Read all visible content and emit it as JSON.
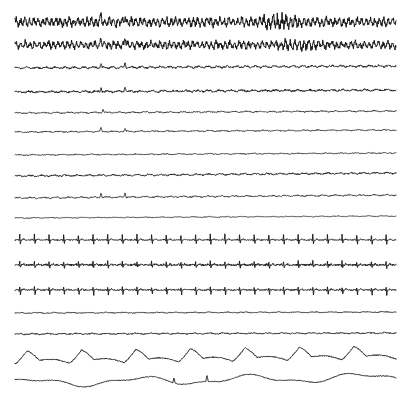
{
  "figure": {
    "type": "multichannel-biosignal-strip-chart",
    "background_color": "#ffffff",
    "trace_color": "#141414",
    "width_px": 410,
    "height_px": 397,
    "plot_left_px": 15,
    "plot_right_px": 396,
    "channel_count": 17
  },
  "chart_data": {
    "type": "line",
    "subtitle": "",
    "xlabel": "",
    "ylabel": "",
    "grid": false,
    "legend_position": "none",
    "xlim": [
      0,
      1
    ],
    "x_start_px": 15,
    "x_end_px": 396,
    "channels": [
      {
        "index": 1,
        "name": "eeg-1",
        "label": "",
        "baseline_y_px": 22,
        "style": "dense-eeg",
        "amplitude_px": 5.0,
        "noise_px": 1.6,
        "cycles": 86,
        "stroke_width": 1.0,
        "artifact_spikes": [
          {
            "x_px": 101,
            "amp_px": 7
          },
          {
            "x_px": 125,
            "amp_px": 8
          }
        ],
        "burst": {
          "x_px": 277,
          "width_px": 26,
          "gain": 1.9
        }
      },
      {
        "index": 2,
        "name": "eeg-2",
        "label": "",
        "baseline_y_px": 45,
        "style": "dense-eeg",
        "amplitude_px": 4.2,
        "noise_px": 1.5,
        "cycles": 82,
        "stroke_width": 1.0,
        "artifact_spikes": [
          {
            "x_px": 101,
            "amp_px": 8
          },
          {
            "x_px": 125,
            "amp_px": 9
          }
        ],
        "burst": {
          "x_px": 300,
          "width_px": 30,
          "gain": 1.7
        }
      },
      {
        "index": 3,
        "name": "eog-left",
        "label": "",
        "baseline_y_px": 68,
        "style": "flat",
        "amplitude_px": 0.7,
        "noise_px": 0.7,
        "cycles": 40,
        "stroke_width": 0.9,
        "drift_px": -2,
        "artifact_spikes": [
          {
            "x_px": 101,
            "amp_px": 4
          },
          {
            "x_px": 125,
            "amp_px": 5
          }
        ]
      },
      {
        "index": 4,
        "name": "eog-right",
        "label": "",
        "baseline_y_px": 92,
        "style": "flat",
        "amplitude_px": 0.6,
        "noise_px": 0.8,
        "cycles": 34,
        "stroke_width": 0.9,
        "drift_px": -2,
        "artifact_spikes": [
          {
            "x_px": 101,
            "amp_px": 5
          },
          {
            "x_px": 125,
            "amp_px": 6
          }
        ]
      },
      {
        "index": 5,
        "name": "emg-chin",
        "label": "",
        "baseline_y_px": 113,
        "style": "flat",
        "amplitude_px": 0.4,
        "noise_px": 0.5,
        "cycles": 30,
        "stroke_width": 0.8,
        "drift_px": -2,
        "artifact_spikes": [
          {
            "x_px": 103,
            "amp_px": 4
          }
        ]
      },
      {
        "index": 6,
        "name": "eeg-3",
        "label": "",
        "baseline_y_px": 132,
        "style": "flat",
        "amplitude_px": 0.35,
        "noise_px": 0.45,
        "cycles": 28,
        "stroke_width": 0.8,
        "drift_px": -2,
        "artifact_spikes": [
          {
            "x_px": 101,
            "amp_px": 4
          },
          {
            "x_px": 125,
            "amp_px": 3
          }
        ]
      },
      {
        "index": 7,
        "name": "eeg-4",
        "label": "",
        "baseline_y_px": 155,
        "style": "flat",
        "amplitude_px": 0.3,
        "noise_px": 0.4,
        "cycles": 26,
        "stroke_width": 0.8,
        "drift_px": -2,
        "artifact_spikes": []
      },
      {
        "index": 8,
        "name": "eeg-5",
        "label": "",
        "baseline_y_px": 176,
        "style": "flat",
        "amplitude_px": 0.5,
        "noise_px": 0.6,
        "cycles": 32,
        "stroke_width": 0.9,
        "drift_px": -3,
        "artifact_spikes": []
      },
      {
        "index": 9,
        "name": "eeg-6",
        "label": "",
        "baseline_y_px": 198,
        "style": "flat",
        "amplitude_px": 0.45,
        "noise_px": 0.5,
        "cycles": 30,
        "stroke_width": 0.8,
        "drift_px": -3,
        "artifact_spikes": [
          {
            "x_px": 101,
            "amp_px": 5
          },
          {
            "x_px": 125,
            "amp_px": 5
          }
        ]
      },
      {
        "index": 10,
        "name": "eeg-7",
        "label": "",
        "baseline_y_px": 218,
        "style": "flat",
        "amplitude_px": 0.25,
        "noise_px": 0.3,
        "cycles": 24,
        "stroke_width": 0.8,
        "drift_px": -2,
        "artifact_spikes": []
      },
      {
        "index": 11,
        "name": "ecg-1",
        "label": "",
        "baseline_y_px": 240,
        "style": "ecg",
        "beats": 26,
        "r_amp_px": 6,
        "s_amp_px": 4,
        "noise_px": 0.5,
        "stroke_width": 0.9,
        "heart_rate_bpm": 78
      },
      {
        "index": 12,
        "name": "ecg-2",
        "label": "",
        "baseline_y_px": 265,
        "style": "ecg",
        "beats": 26,
        "r_amp_px": 4,
        "s_amp_px": 3,
        "noise_px": 0.9,
        "stroke_width": 0.9,
        "heart_rate_bpm": 78
      },
      {
        "index": 13,
        "name": "ecg-3",
        "label": "",
        "baseline_y_px": 290,
        "style": "ecg",
        "beats": 26,
        "r_amp_px": 3,
        "s_amp_px": 5,
        "noise_px": 0.6,
        "stroke_width": 0.9,
        "heart_rate_bpm": 78
      },
      {
        "index": 14,
        "name": "spo2",
        "label": "",
        "baseline_y_px": 313,
        "style": "flat",
        "amplitude_px": 0.3,
        "noise_px": 0.35,
        "cycles": 22,
        "stroke_width": 0.9,
        "drift_px": -1,
        "artifact_spikes": []
      },
      {
        "index": 15,
        "name": "snore",
        "label": "",
        "baseline_y_px": 334,
        "style": "flat",
        "amplitude_px": 0.4,
        "noise_px": 0.5,
        "cycles": 26,
        "stroke_width": 0.9,
        "drift_px": -1,
        "artifact_spikes": []
      },
      {
        "index": 16,
        "name": "respiration-airflow",
        "label": "",
        "baseline_y_px": 364,
        "style": "respiration",
        "breaths": 7,
        "amplitude_px": 13,
        "noise_px": 0.5,
        "stroke_width": 0.9,
        "drift_px": -5,
        "respiration_rate_per_strip": 7
      },
      {
        "index": 17,
        "name": "respiration-effort",
        "label": "",
        "baseline_y_px": 383,
        "style": "slow-drift",
        "amplitude_px": 3.5,
        "noise_px": 0.4,
        "cycles": 3.5,
        "stroke_width": 0.9,
        "drift_px": -6,
        "artifact_spikes": [
          {
            "x_px": 174,
            "amp_px": 5
          },
          {
            "x_px": 207,
            "amp_px": 6
          }
        ]
      }
    ]
  }
}
